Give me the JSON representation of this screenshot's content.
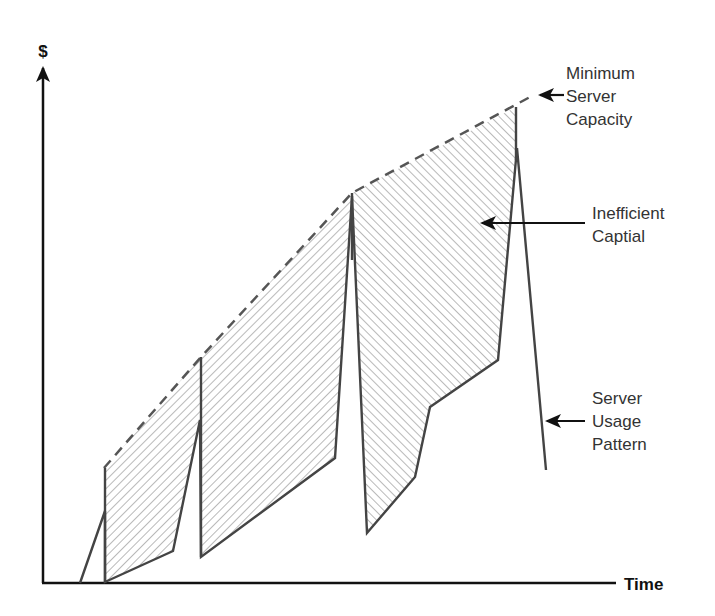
{
  "diagram": {
    "axes": {
      "y_label": "$",
      "x_label": "Time",
      "origin": [
        43,
        583
      ],
      "y_top": 68,
      "x_end": 616
    },
    "colors": {
      "axis": "#111111",
      "usage_line": "#444444",
      "capacity_line": "#555555",
      "hatch": "#9a9a9a",
      "text": "#333333"
    },
    "capacity_line": {
      "style": "dashed",
      "points": [
        [
          104,
          468
        ],
        [
          201,
          357
        ],
        [
          352,
          193
        ],
        [
          530,
          97
        ]
      ]
    },
    "usage_pattern": {
      "points": [
        [
          80,
          583
        ],
        [
          105,
          511
        ],
        [
          105,
          582
        ],
        [
          173,
          551
        ],
        [
          200,
          420
        ],
        [
          201,
          557
        ],
        [
          335,
          458
        ],
        [
          352,
          196
        ],
        [
          367,
          533
        ],
        [
          415,
          477
        ],
        [
          430,
          407
        ],
        [
          498,
          360
        ],
        [
          517,
          148
        ],
        [
          546,
          470
        ]
      ]
    },
    "vertical_steps": [
      {
        "x": 105,
        "y1": 468,
        "y2": 583
      },
      {
        "x": 201,
        "y1": 357,
        "y2": 557
      },
      {
        "x": 352,
        "y1": 193,
        "y2": 260
      },
      {
        "x": 516,
        "y1": 107,
        "y2": 160
      }
    ],
    "hatched_regions": [
      {
        "direction": "backslash",
        "points": [
          [
            105,
            468
          ],
          [
            201,
            357
          ],
          [
            200,
            420
          ],
          [
            173,
            551
          ],
          [
            105,
            582
          ]
        ]
      },
      {
        "direction": "backslash",
        "points": [
          [
            201,
            357
          ],
          [
            352,
            193
          ],
          [
            335,
            458
          ],
          [
            201,
            557
          ]
        ]
      },
      {
        "direction": "slash",
        "points": [
          [
            352,
            193
          ],
          [
            516,
            107
          ],
          [
            517,
            150
          ],
          [
            498,
            360
          ],
          [
            430,
            407
          ],
          [
            415,
            477
          ],
          [
            367,
            533
          ]
        ]
      }
    ],
    "annotations": [
      {
        "id": "minimum-server-capacity",
        "lines": [
          "Minimum",
          "Server",
          "Capacity"
        ],
        "text_x": 566,
        "text_y": 79,
        "arrow_from": [
          564,
          95
        ],
        "arrow_to": [
          540,
          95
        ]
      },
      {
        "id": "inefficient-capital",
        "lines": [
          "Inefficient",
          "Captial"
        ],
        "text_x": 592,
        "text_y": 219,
        "arrow_from": [
          585,
          223
        ],
        "arrow_to": [
          482,
          223
        ]
      },
      {
        "id": "server-usage-pattern",
        "lines": [
          "Server",
          "Usage",
          "Pattern"
        ],
        "text_x": 592,
        "text_y": 404,
        "arrow_from": [
          585,
          421
        ],
        "arrow_to": [
          547,
          421
        ]
      }
    ]
  }
}
